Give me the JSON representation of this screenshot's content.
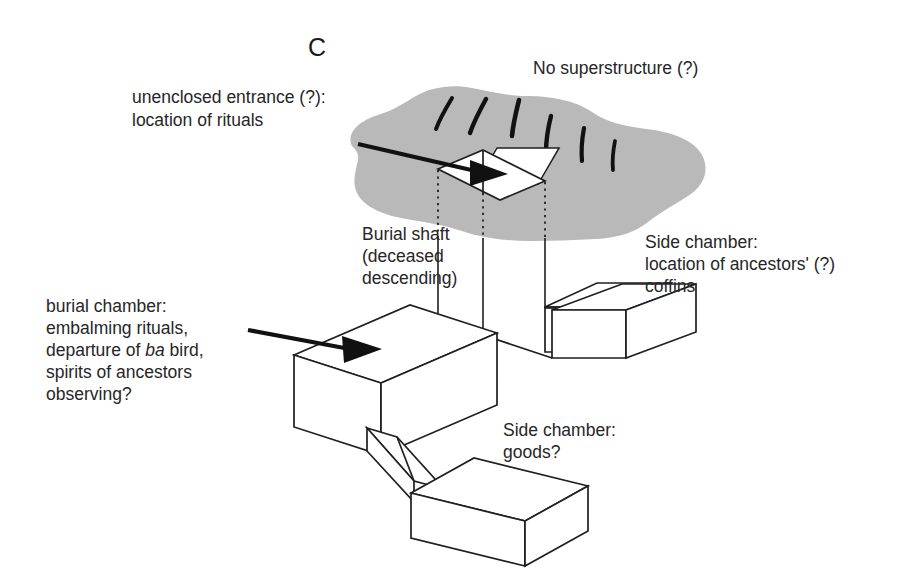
{
  "figure": {
    "panel_letter": "C",
    "background_color": "#ffffff",
    "ink_color": "#1f1f1f",
    "ground_blob_color": "#b9b9b9"
  },
  "labels": {
    "no_superstructure": "No superstructure (?)",
    "unenclosed_entrance_line1": "unenclosed entrance (?):",
    "unenclosed_entrance_line2": "location of rituals",
    "burial_shaft_line1": "Burial shaft",
    "burial_shaft_line2": "(deceased",
    "burial_shaft_line3": "descending)",
    "side_chamber_coffins_line1": "Side chamber:",
    "side_chamber_coffins_line2": "location of ancestors' (?)",
    "side_chamber_coffins_line3": "coffins",
    "burial_chamber_line1": "burial chamber:",
    "burial_chamber_line2": "embalming rituals,",
    "burial_chamber_line3_a": "departure of ",
    "burial_chamber_line3_b": "ba",
    "burial_chamber_line3_c": " bird,",
    "burial_chamber_line4": "spirits of ancestors",
    "burial_chamber_line5": "observing?",
    "side_chamber_goods_line1": "Side chamber:",
    "side_chamber_goods_line2": "goods?"
  },
  "icons": {
    "entrance_arrow": "arrow-right-icon",
    "chamber_arrow": "arrow-right-icon",
    "ground_vegetation": "grass-tufts-icon"
  }
}
